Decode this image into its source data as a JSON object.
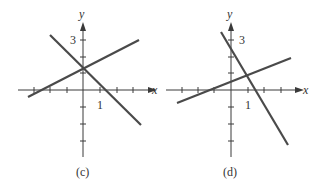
{
  "panels": [
    {
      "id": "c",
      "caption": "(c)",
      "x_label": "x",
      "y_label": "y",
      "tick_label_y": "3",
      "tick_label_x": "1",
      "lines": [
        {
          "name": "line-positive-slope"
        },
        {
          "name": "line-negative-slope"
        }
      ]
    },
    {
      "id": "d",
      "caption": "(d)",
      "x_label": "x",
      "y_label": "y",
      "tick_label_y": "3",
      "tick_label_x": "1",
      "lines": [
        {
          "name": "line-positive-slope"
        },
        {
          "name": "line-negative-slope"
        }
      ]
    }
  ],
  "colors": {
    "axis": "#3a3a3a",
    "line": "#4a4a4a"
  }
}
